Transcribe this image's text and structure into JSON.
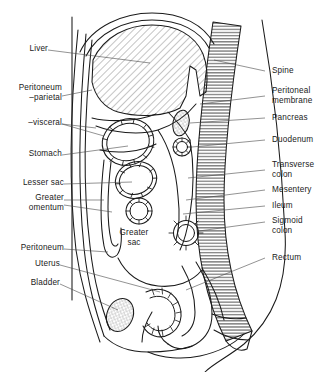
{
  "figure": {
    "type": "anatomical-diagram",
    "view": "sagittal",
    "background_color": "#ffffff",
    "line_color": "#1a1a1a",
    "text_color": "#1a1a1a"
  },
  "labels_left": [
    {
      "id": "liver",
      "text": "Liver"
    },
    {
      "id": "peritoneum-parietal",
      "text": "Peritoneum\n–parietal"
    },
    {
      "id": "visceral",
      "text": "–visceral"
    },
    {
      "id": "stomach",
      "text": "Stomach"
    },
    {
      "id": "lesser-sac",
      "text": "Lesser sac"
    },
    {
      "id": "greater-omentum",
      "text": "Greater\nomentum"
    },
    {
      "id": "peritoneum",
      "text": "Peritoneum"
    },
    {
      "id": "uterus",
      "text": "Uterus"
    },
    {
      "id": "bladder",
      "text": "Bladder"
    }
  ],
  "labels_right": [
    {
      "id": "spine",
      "text": "Spine"
    },
    {
      "id": "peritoneal-membrane",
      "text": "Peritoneal\nmembrane"
    },
    {
      "id": "pancreas",
      "text": "Pancreas"
    },
    {
      "id": "duodenum",
      "text": "Duodenum"
    },
    {
      "id": "transverse-colon",
      "text": "Transverse\ncolon"
    },
    {
      "id": "mesentery",
      "text": "Mesentery"
    },
    {
      "id": "ileum",
      "text": "Ileum"
    },
    {
      "id": "sigmoid-colon",
      "text": "Sigmoid\ncolon"
    },
    {
      "id": "rectum",
      "text": "Rectum"
    }
  ],
  "labels_inner": [
    {
      "id": "greater-sac",
      "text": "Greater\nsac"
    }
  ],
  "structures": [
    {
      "id": "liver",
      "fill": "diagonal-hatch"
    },
    {
      "id": "spine",
      "fill": "horizontal-hatch"
    },
    {
      "id": "stomach",
      "fill": "bowel-ring"
    },
    {
      "id": "lesser-sac",
      "fill": "bowel-ring"
    },
    {
      "id": "ileum",
      "fill": "bowel-ring"
    },
    {
      "id": "sigmoid-colon",
      "fill": "bowel-ring"
    },
    {
      "id": "pancreas",
      "fill": "stipple"
    },
    {
      "id": "duodenum",
      "fill": "bowel-ring"
    },
    {
      "id": "bladder",
      "fill": "stipple"
    },
    {
      "id": "uterus",
      "fill": "bowel-ring"
    },
    {
      "id": "rectum",
      "fill": "plain"
    },
    {
      "id": "greater-omentum",
      "fill": "plain"
    },
    {
      "id": "transverse-colon",
      "fill": "plain"
    },
    {
      "id": "mesentery",
      "fill": "horizontal-hatch"
    },
    {
      "id": "greater-sac",
      "fill": "plain"
    }
  ]
}
